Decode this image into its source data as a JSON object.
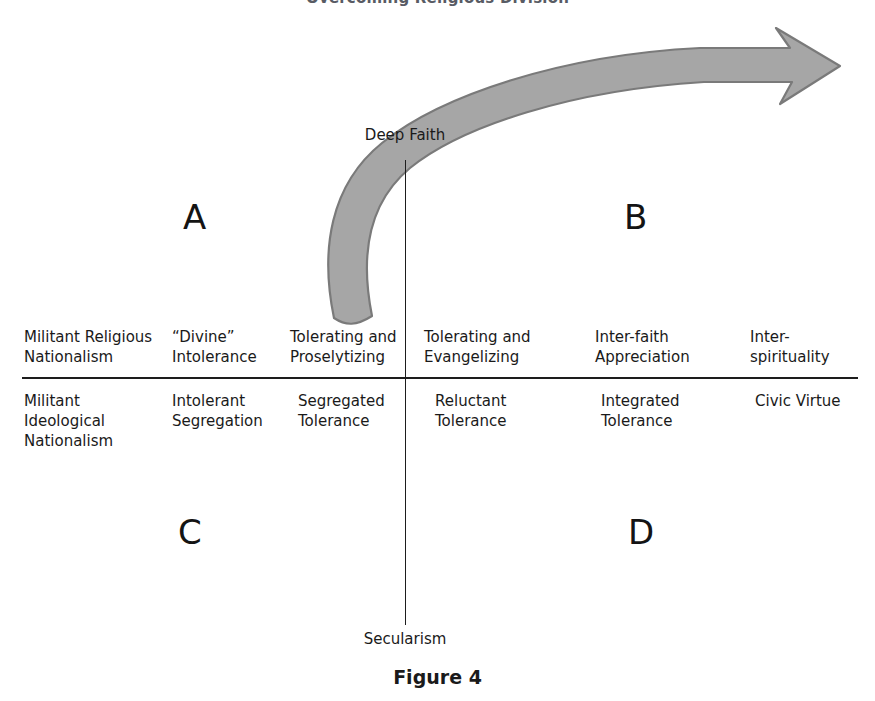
{
  "figure": {
    "title": "Overcoming Religious Division",
    "caption": "Figure 4",
    "accent_gray": "#a6a6a6",
    "accent_gray_outline": "#7d7d7d",
    "line_color": "#1d1d1d"
  },
  "axes": {
    "vertical": {
      "top_label": "Deep Faith",
      "bottom_label": "Secularism"
    }
  },
  "quadrants": [
    {
      "id": "A",
      "label": "A",
      "position": "upper-left"
    },
    {
      "id": "B",
      "label": "B",
      "position": "upper-right"
    },
    {
      "id": "C",
      "label": "C",
      "position": "lower-left"
    },
    {
      "id": "D",
      "label": "D",
      "position": "lower-right"
    }
  ],
  "upper_row": [
    {
      "label": "Militant Religious Nationalism"
    },
    {
      "label": "“Divine” Intolerance"
    },
    {
      "label": "Tolerating and Proselytizing"
    },
    {
      "label": "Tolerating and Evangelizing"
    },
    {
      "label": "Inter-faith Appreciation"
    },
    {
      "label": "Inter-spirituality"
    }
  ],
  "lower_row": [
    {
      "label": "Militant Ideological Nationalism"
    },
    {
      "label": "Intolerant Segregation"
    },
    {
      "label": "Segregated Tolerance"
    },
    {
      "label": "Reluctant Tolerance"
    },
    {
      "label": "Integrated Tolerance"
    },
    {
      "label": "Civic Virtue"
    }
  ],
  "arrow": {
    "name": "progression-arrow",
    "description": "curved gray arrow sweeping from Tolerating and Proselytizing upward and right past Deep Faith toward Inter-spirituality"
  }
}
